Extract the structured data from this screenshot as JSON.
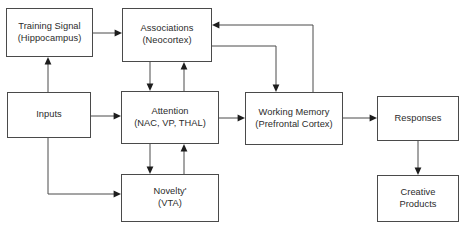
{
  "diagram": {
    "canvas": {
      "width": 467,
      "height": 230
    },
    "colors": {
      "background": "#ffffff",
      "box_border": "#4a4a4a",
      "edge_stroke": "#4a4a4a",
      "arrow_head": "#1d1d1d",
      "text": "#2b2b2b"
    },
    "nodes": [
      {
        "id": "training-signal",
        "line1": "Training Signal",
        "line2": "(Hippocampus)",
        "x": 6,
        "y": 8,
        "w": 87,
        "h": 49
      },
      {
        "id": "associations",
        "line1": "Associations",
        "line2": "(Neocortex)",
        "x": 122,
        "y": 8,
        "w": 90,
        "h": 54
      },
      {
        "id": "inputs",
        "line1": "Inputs",
        "line2": "",
        "x": 7,
        "y": 92,
        "w": 84,
        "h": 46
      },
      {
        "id": "attention",
        "line1": "Attention",
        "line2": "(NAC, VP, THAL)",
        "x": 121,
        "y": 91,
        "w": 98,
        "h": 53
      },
      {
        "id": "working-memory",
        "line1": "Working Memory",
        "line2": "(Prefrontal Cortex)",
        "x": 245,
        "y": 92,
        "w": 98,
        "h": 53
      },
      {
        "id": "responses",
        "line1": "Responses",
        "line2": "",
        "x": 377,
        "y": 96,
        "w": 82,
        "h": 45
      },
      {
        "id": "novelty",
        "line1": "Novelty'",
        "line2": "(VTA)",
        "x": 121,
        "y": 174,
        "w": 98,
        "h": 48
      },
      {
        "id": "creative-products",
        "line1": "Creative",
        "line2": "Products",
        "x": 377,
        "y": 175,
        "w": 82,
        "h": 47
      }
    ],
    "edges": [
      {
        "id": "inputs-to-training-signal",
        "from": "inputs",
        "to": "training-signal",
        "label": ""
      },
      {
        "id": "training-signal-to-associations",
        "from": "training-signal",
        "to": "associations",
        "label": ""
      },
      {
        "id": "inputs-to-attention",
        "from": "inputs",
        "to": "attention",
        "label": ""
      },
      {
        "id": "inputs-to-novelty",
        "from": "inputs",
        "to": "novelty",
        "label": ""
      },
      {
        "id": "associations-to-attention",
        "from": "associations",
        "to": "attention",
        "label": ""
      },
      {
        "id": "attention-to-associations",
        "from": "attention",
        "to": "associations",
        "label": ""
      },
      {
        "id": "attention-to-novelty",
        "from": "attention",
        "to": "novelty",
        "label": ""
      },
      {
        "id": "novelty-to-attention",
        "from": "novelty",
        "to": "attention",
        "label": ""
      },
      {
        "id": "attention-to-working-memory",
        "from": "attention",
        "to": "working-memory",
        "label": ""
      },
      {
        "id": "associations-to-working-memory",
        "from": "associations",
        "to": "working-memory",
        "label": ""
      },
      {
        "id": "working-memory-to-associations",
        "from": "working-memory",
        "to": "associations",
        "label": ""
      },
      {
        "id": "working-memory-to-responses",
        "from": "working-memory",
        "to": "responses",
        "label": ""
      },
      {
        "id": "responses-to-creative-products",
        "from": "responses",
        "to": "creative-products",
        "label": ""
      }
    ]
  }
}
